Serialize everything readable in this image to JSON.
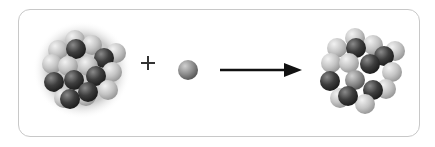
{
  "diagram": {
    "type": "nuclear-reaction",
    "left": {
      "label": "nucleus",
      "shade": "clustered spheres (light and dark gray)"
    },
    "operator": "+",
    "particle": {
      "label": "neutron",
      "color": "#8a8a8a"
    },
    "arrow": {
      "direction": "right",
      "color": "#111111"
    },
    "right": {
      "label": "compound-nucleus",
      "shade": "clustered spheres (light and dark gray)"
    },
    "colors": {
      "light_sphere": "#c6c6c6",
      "dark_sphere": "#3a3a3a",
      "mid_sphere": "#8e8e8e",
      "frame": "#c8c8c8"
    }
  }
}
